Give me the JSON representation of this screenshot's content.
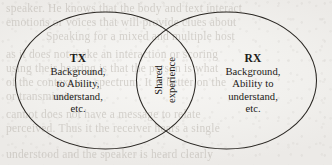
{
  "figure": {
    "type": "venn-diagram",
    "set_count": 2,
    "background_color": "#f2f1ef",
    "stroke_color": "#2a2723"
  },
  "left_set": {
    "heading": "TX",
    "lines": [
      "Background,",
      "to Ability,",
      "understand,",
      "etc."
    ]
  },
  "right_set": {
    "heading": "RX",
    "lines": [
      "Background,",
      "Ability to",
      "understand,",
      "etc."
    ]
  },
  "overlap": {
    "lines": [
      "Shared",
      "experience"
    ],
    "orientation": "vertical"
  },
  "bleed_through": {
    "lines": [
      {
        "text": "speaker. He knows that the body and text interact",
        "x": 6,
        "y": 2
      },
      {
        "text": "emotions or voices that will provide clues about",
        "x": 6,
        "y": 16
      },
      {
        "text": "Speaking for a mixed and multiple host",
        "x": 46,
        "y": 30
      },
      {
        "text": "as it does not make an interaction or scoring",
        "x": 6,
        "y": 48
      },
      {
        "text": "using their hearing is that the person is what",
        "x": 6,
        "y": 62
      },
      {
        "text": "of the context is a spectrum. It is better on the",
        "x": 6,
        "y": 76
      },
      {
        "text": "or transmission",
        "x": 6,
        "y": 90
      },
      {
        "text": "cannot does not have a message to relate",
        "x": 6,
        "y": 108
      },
      {
        "text": "perceived. Thus it the receiver hears a single",
        "x": 6,
        "y": 122
      },
      {
        "text": "understood and the speaker is heard clearly",
        "x": 6,
        "y": 148
      }
    ]
  }
}
